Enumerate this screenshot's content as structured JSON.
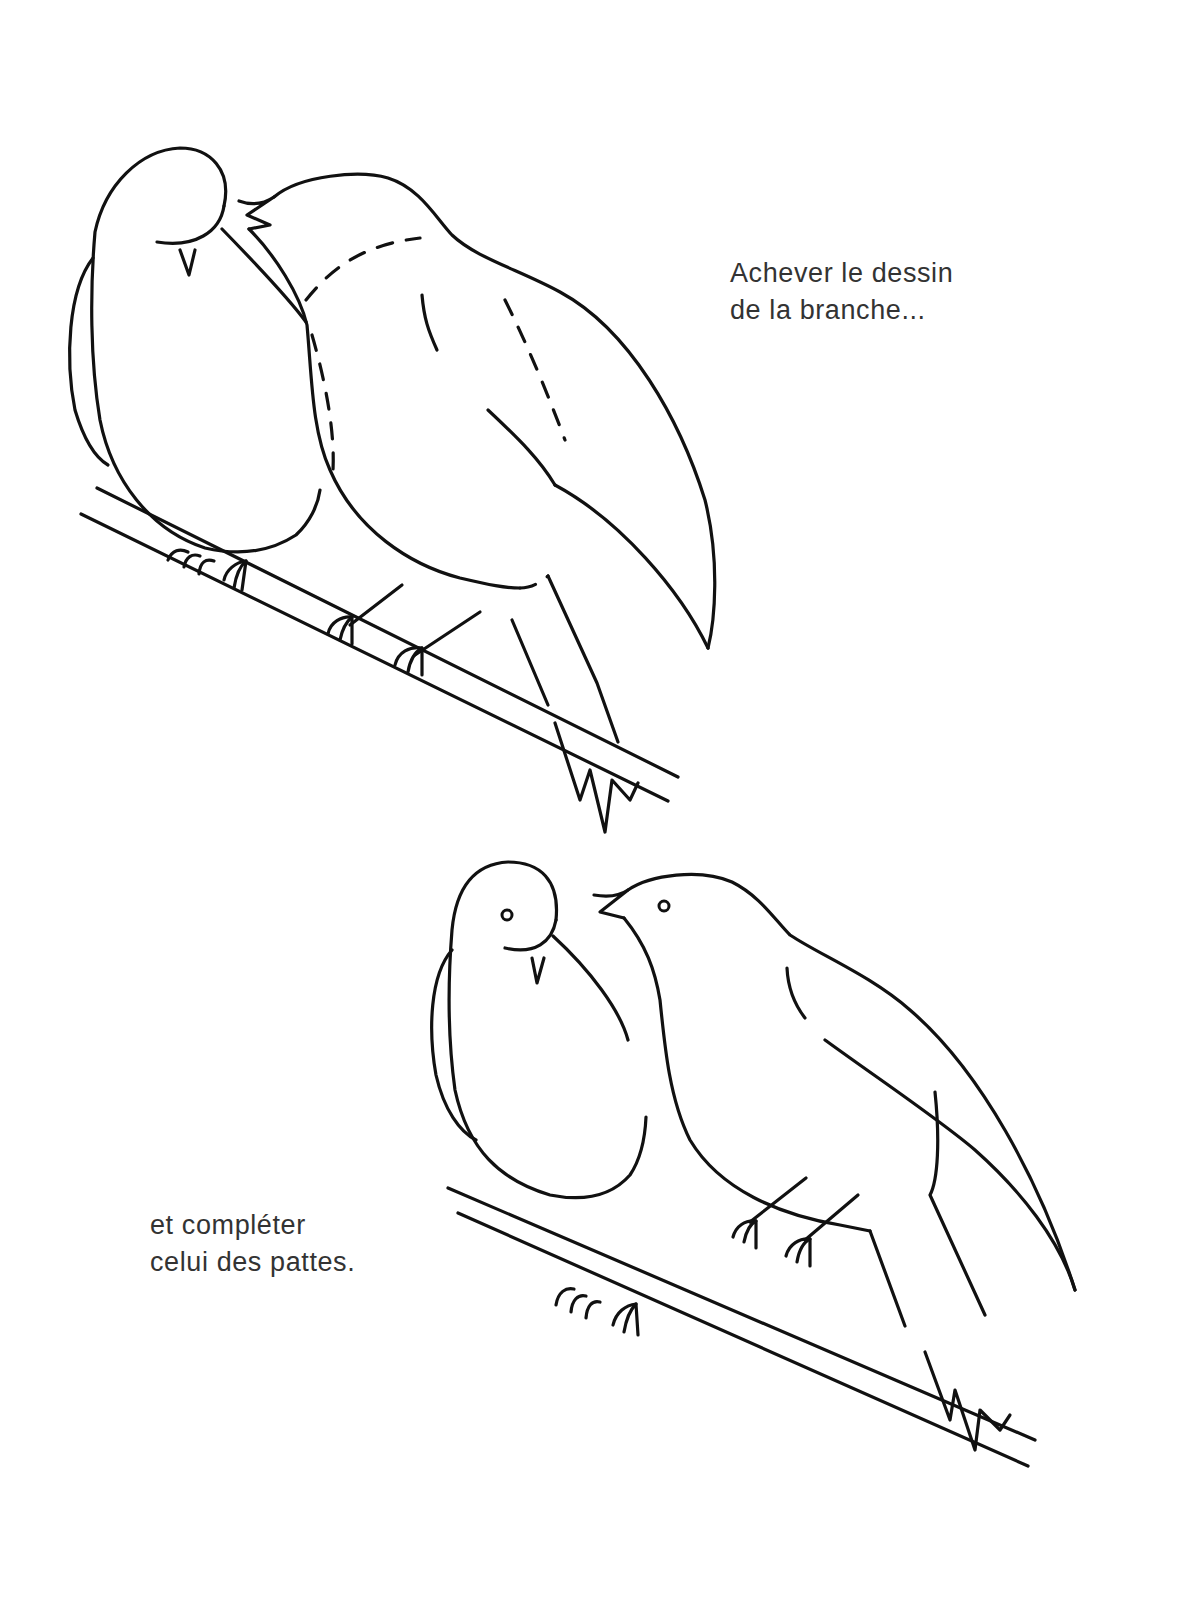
{
  "page": {
    "background": "#ffffff",
    "ink_color": "#111111",
    "text_color": "#333333"
  },
  "captions": {
    "top": {
      "line1": "Achever le dessin",
      "line2": "de la branche..."
    },
    "bottom": {
      "line1": "et compléter",
      "line2": "celui des pattes."
    }
  },
  "illustrations": {
    "top": {
      "description": "Two birds perched on an unfinished branch; dashed guide lines on the right bird",
      "icon": "birds-on-branch-incomplete"
    },
    "bottom": {
      "description": "Two birds perched on a completed branch, facing each other",
      "icon": "birds-on-branch-complete"
    }
  }
}
